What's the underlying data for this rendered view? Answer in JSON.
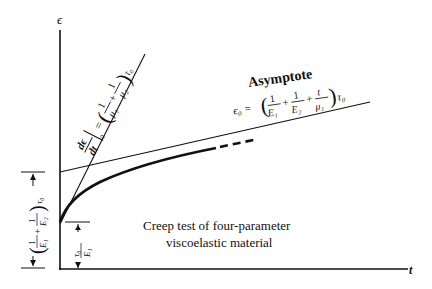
{
  "diagram": {
    "caption_lines": [
      "Creep test of four-parameter",
      "viscoelastic material"
    ],
    "axes": {
      "y_label": "ϵ",
      "x_label": "t"
    },
    "asymptote": {
      "label": "Asymptote",
      "eq_lhs": "ϵ₀ =",
      "terms": [
        {
          "num": "1",
          "den": "E₁"
        },
        {
          "num": "1",
          "den": "E₂"
        },
        {
          "num": "t",
          "den": "μ₁"
        }
      ],
      "suffix": "τ₀"
    },
    "tangent": {
      "lhs_num": "dϵ",
      "lhs_den": "dt",
      "lhs_sub": "0",
      "terms": [
        {
          "num": "1",
          "den": "μ₁"
        },
        {
          "num": "1",
          "den": "μ₂"
        }
      ],
      "suffix": "τ₀"
    },
    "dims": {
      "instant_strain": {
        "num": "τ₀",
        "den": "E₁"
      },
      "asymptote_intercept": {
        "terms": [
          {
            "num": "1",
            "den": "E₁"
          },
          {
            "num": "1",
            "den": "E₂"
          }
        ],
        "suffix": "τ₀"
      }
    }
  }
}
